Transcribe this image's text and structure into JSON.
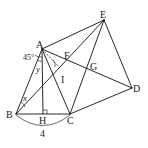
{
  "diagram": {
    "points": {
      "A": {
        "label": "A",
        "x": 42,
        "y": 49
      },
      "E": {
        "label": "E",
        "x": 104,
        "y": 20
      },
      "F": {
        "label": "F",
        "x": 68,
        "y": 60
      },
      "G": {
        "label": "G",
        "x": 89,
        "y": 66
      },
      "I": {
        "label": "I",
        "x": 62,
        "y": 73
      },
      "D": {
        "label": "D",
        "x": 132,
        "y": 88
      },
      "B": {
        "label": "B",
        "x": 16,
        "y": 114
      },
      "H": {
        "label": "H",
        "x": 43,
        "y": 114
      },
      "C": {
        "label": "C",
        "x": 70,
        "y": 114
      }
    },
    "angle_labels": {
      "angle_45": "45°",
      "angle_x": "x",
      "angle_y": "y"
    },
    "length_labels": {
      "bc_length": "4"
    },
    "colors": {
      "stroke": "#2a2a2a",
      "background": "#ffffff"
    }
  }
}
